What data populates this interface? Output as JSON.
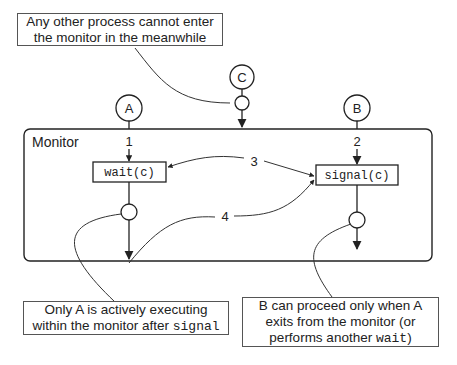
{
  "diagram": {
    "type": "monitor-signal-semantics",
    "monitor_label": "Monitor",
    "processes": [
      {
        "id": "A",
        "label": "A"
      },
      {
        "id": "B",
        "label": "B"
      },
      {
        "id": "C",
        "label": "C"
      }
    ],
    "operations": {
      "wait": "wait(c)",
      "signal": "signal(c)"
    },
    "step_labels": {
      "s1": "1",
      "s2": "2",
      "s3": "3",
      "s4": "4"
    },
    "notes": {
      "top": {
        "line1": "Any other process cannot enter",
        "line2": "the monitor in the meanwhile"
      },
      "bottom_left": {
        "line1": "Only A is actively executing",
        "line2_text": "within the monitor after ",
        "line2_code": "signal"
      },
      "bottom_right": {
        "line1": "B can proceed only when A",
        "line2": "exits from the monitor (or",
        "line3_text": "performs another ",
        "line3_code": "wait",
        "line3_end": ")"
      }
    }
  }
}
